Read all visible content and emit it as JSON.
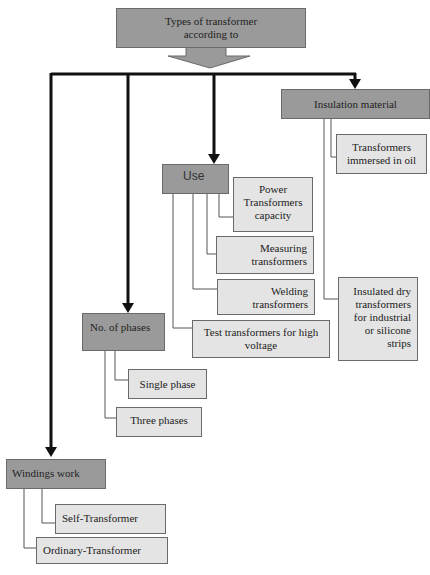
{
  "diagram": {
    "root": "Types of transformer according to",
    "root_lines": [
      "Types of transformer",
      "according to"
    ],
    "categories": [
      {
        "label": "Insulation material",
        "children": [
          {
            "label": "Transformers immersed in oil",
            "lines": [
              "Transformers",
              "immersed in oil"
            ]
          },
          {
            "label": "Insulated dry transformers for industrial or silicone strips",
            "lines": [
              "Insulated dry",
              "transformers",
              "for industrial",
              "or silicone",
              "strips"
            ]
          }
        ]
      },
      {
        "label": "Use",
        "children": [
          {
            "label": "Power Transformers capacity",
            "lines": [
              "Power",
              "Transformers",
              "capacity"
            ]
          },
          {
            "label": "Measuring transformers",
            "lines": [
              "Measuring",
              "transformers"
            ]
          },
          {
            "label": "Welding transformers",
            "lines": [
              "Welding",
              "transformers"
            ]
          },
          {
            "label": "Test transformers for high voltage",
            "lines": [
              "Test transformers for high",
              "voltage"
            ]
          }
        ]
      },
      {
        "label": "No. of phases",
        "children": [
          {
            "label": "Single phase"
          },
          {
            "label": "Three phases"
          }
        ]
      },
      {
        "label": "Windings work",
        "children": [
          {
            "label": "Self-Transformer"
          },
          {
            "label": "Ordinary-Transformer"
          }
        ]
      }
    ]
  }
}
